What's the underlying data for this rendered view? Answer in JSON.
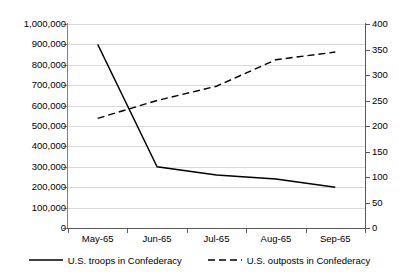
{
  "chart_data": {
    "type": "line",
    "title": "",
    "xlabel": "",
    "ylabel": "",
    "grid": true,
    "legend_position": "bottom",
    "categories": [
      "May-65",
      "Jun-65",
      "Jul-65",
      "Aug-65",
      "Sep-65"
    ],
    "axes": {
      "left": {
        "ylim": [
          0,
          1000000
        ],
        "ticks": [
          0,
          100000,
          200000,
          300000,
          400000,
          500000,
          600000,
          700000,
          800000,
          900000,
          1000000
        ],
        "tick_labels": [
          "0",
          "100,000",
          "200,000",
          "300,000",
          "400,000",
          "500,000",
          "600,000",
          "700,000",
          "800,000",
          "900,000",
          "1,000,000"
        ]
      },
      "right": {
        "ylim": [
          0,
          400
        ],
        "ticks": [
          0,
          50,
          100,
          150,
          200,
          250,
          300,
          350,
          400
        ],
        "tick_labels": [
          "0",
          "50",
          "100",
          "150",
          "200",
          "250",
          "300",
          "350",
          "400"
        ]
      }
    },
    "series": [
      {
        "name": "U.S. troops in Confederacy",
        "axis": "left",
        "style": "solid",
        "color": "#000000",
        "values": [
          900000,
          300000,
          260000,
          240000,
          200000
        ]
      },
      {
        "name": "U.S. outposts in Confederacy",
        "axis": "right",
        "style": "dashed",
        "color": "#000000",
        "values": [
          215,
          250,
          278,
          330,
          345
        ]
      }
    ]
  },
  "legend": {
    "items": [
      {
        "label": "U.S. troops in Confederacy",
        "style": "solid"
      },
      {
        "label": "U.S. outposts in Confederacy",
        "style": "dashed"
      }
    ]
  }
}
